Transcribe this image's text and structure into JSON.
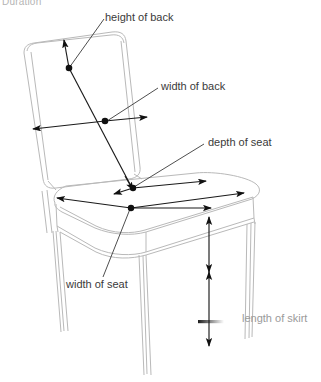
{
  "figure": {
    "type": "technical-line-drawing",
    "corner_text": "Duration",
    "background_color": "#ffffff",
    "outline_color": "#b9b9b9",
    "annotation_color": "#1a1a1a",
    "label_color": "#3a3a3a",
    "faded_label_color": "#9a9a9a"
  },
  "labels": {
    "height_of_back": "height of back",
    "width_of_back": "width of back",
    "depth_of_seat": "depth of seat",
    "width_of_seat": "width of seat",
    "length_of_skirt": "length of skirt"
  }
}
